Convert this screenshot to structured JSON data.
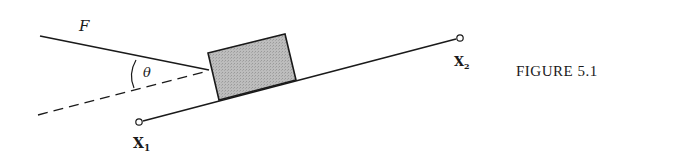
{
  "figure": {
    "caption": "FIGURE 5.1",
    "force_label": "F",
    "angle_label": "θ",
    "point1_label": "X",
    "point1_sub": "1",
    "point2_label": "X",
    "point2_sub": "2"
  },
  "colors": {
    "line": "#1a1a1a",
    "block_fill": "#b8b8b8",
    "background": "#ffffff"
  }
}
